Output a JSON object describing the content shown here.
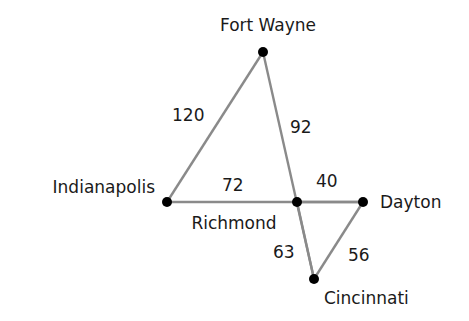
{
  "diagram": {
    "type": "weighted-graph",
    "nodes": [
      {
        "id": "fort_wayne",
        "label": "Fort Wayne",
        "x": 263,
        "y": 52,
        "lx": 268,
        "ly": 31,
        "anchor": "middle"
      },
      {
        "id": "indianapolis",
        "label": "Indianapolis",
        "x": 167,
        "y": 202,
        "lx": 155,
        "ly": 193,
        "anchor": "end"
      },
      {
        "id": "richmond",
        "label": "Richmond",
        "x": 297,
        "y": 202,
        "lx": 234,
        "ly": 229,
        "anchor": "middle"
      },
      {
        "id": "dayton",
        "label": "Dayton",
        "x": 363,
        "y": 202,
        "lx": 380,
        "ly": 208,
        "anchor": "start"
      },
      {
        "id": "cincinnati",
        "label": "Cincinnati",
        "x": 314,
        "y": 279,
        "lx": 324,
        "ly": 304,
        "anchor": "start"
      }
    ],
    "edges": [
      {
        "from": "fort_wayne",
        "to": "indianapolis",
        "weight": "120",
        "lx": 172,
        "ly": 121
      },
      {
        "from": "fort_wayne",
        "to": "cincinnati",
        "weight": "92",
        "lx": 290,
        "ly": 133
      },
      {
        "from": "indianapolis",
        "to": "dayton",
        "weight": "72",
        "lx": 222,
        "ly": 191
      },
      {
        "from": "richmond",
        "to": "dayton",
        "weight": "40",
        "lx": 316,
        "ly": 187
      },
      {
        "from": "richmond",
        "to": "cincinnati",
        "weight": "63",
        "lx": 273,
        "ly": 258
      },
      {
        "from": "dayton",
        "to": "cincinnati",
        "weight": "56",
        "lx": 348,
        "ly": 261
      }
    ]
  }
}
